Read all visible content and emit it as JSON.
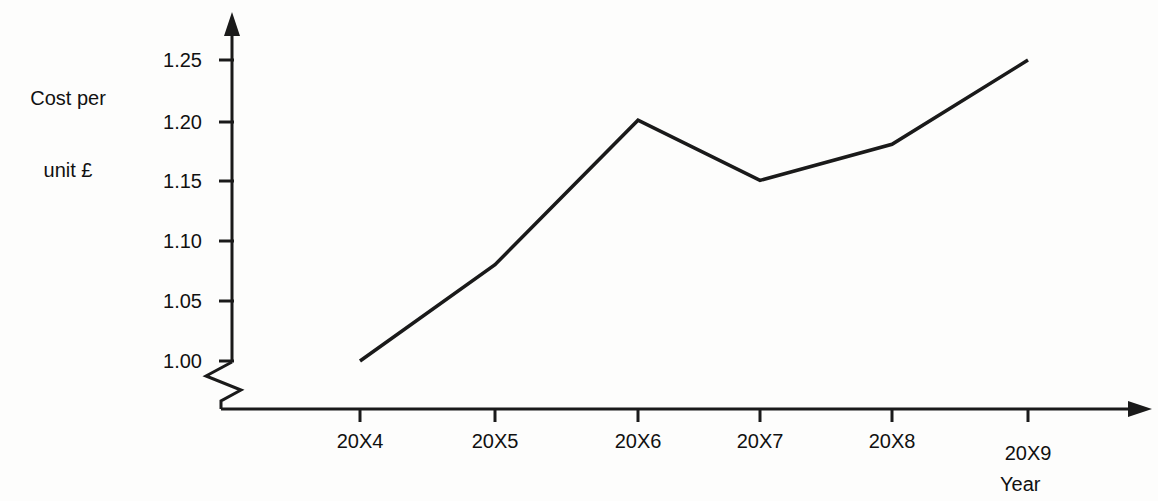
{
  "chart_data": {
    "type": "line",
    "title": "",
    "xlabel": "Year",
    "ylabel": "Cost per\nunit £",
    "categories": [
      "20X4",
      "20X5",
      "20X6",
      "20X7",
      "20X8",
      "20X9"
    ],
    "values": [
      1.0,
      1.08,
      1.2,
      1.15,
      1.18,
      1.25
    ],
    "series": [
      {
        "name": "Cost per unit £",
        "values": [
          1.0,
          1.08,
          1.2,
          1.15,
          1.18,
          1.25
        ]
      }
    ],
    "ytick_labels": [
      "1.00",
      "1.05",
      "1.10",
      "1.15",
      "1.20",
      "1.25"
    ],
    "ytick_values": [
      1.0,
      1.05,
      1.1,
      1.15,
      1.2,
      1.25
    ],
    "ylim": [
      1.0,
      1.25
    ],
    "grid": false,
    "legend": false,
    "axis_break": true,
    "axis_break_note": "zigzag break on y-axis below 1.00",
    "line_color": "#1a1a1a",
    "axis_color": "#1a1a1a",
    "background_color": "#fdfdfc",
    "markers": false
  },
  "labels": {
    "y_axis_line1": "Cost per",
    "y_axis_line2": "unit £",
    "x_axis": "Year",
    "y_ticks": [
      "1.25",
      "1.20",
      "1.15",
      "1.10",
      "1.05",
      "1.00"
    ],
    "x_ticks": [
      "20X4",
      "20X5",
      "20X6",
      "20X7",
      "20X8",
      "20X9"
    ]
  }
}
